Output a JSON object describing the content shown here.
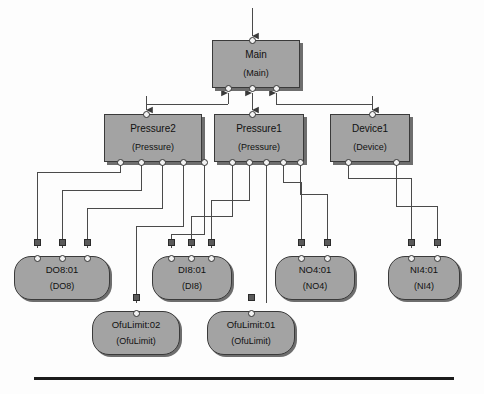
{
  "diagram": {
    "colors": {
      "node_fill": "#a3a3a3",
      "node_border": "#3a3a3a",
      "node_shadow": "#6e6e6e",
      "wire": "#4a4a4a",
      "port_fill": "#f2f2f2",
      "terminator_fill": "#5a5a5a",
      "background": "#fdfdfd"
    },
    "nodes": {
      "main": {
        "name": "Main",
        "type": "(Main)"
      },
      "pressure2": {
        "name": "Pressure2",
        "type": "(Pressure)"
      },
      "pressure1": {
        "name": "Pressure1",
        "type": "(Pressure)"
      },
      "device1": {
        "name": "Device1",
        "type": "(Device)"
      },
      "do8": {
        "name": "DO8:01",
        "type": "(DO8)"
      },
      "di8": {
        "name": "DI8:01",
        "type": "(DI8)"
      },
      "no4": {
        "name": "NO4:01",
        "type": "(NO4)"
      },
      "ni4": {
        "name": "NI4:01",
        "type": "(NI4)"
      },
      "ofulimit02": {
        "name": "OfuLimit:02",
        "type": "(OfuLimit)"
      },
      "ofulimit01": {
        "name": "OfuLimit:01",
        "type": "(OfuLimit)"
      }
    }
  }
}
